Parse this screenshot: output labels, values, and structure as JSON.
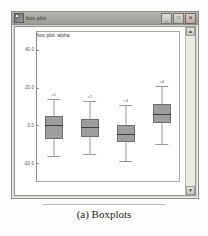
{
  "window": {
    "title": "box plot",
    "icon": "app-icon",
    "buttons": [
      {
        "name": "minimize",
        "glyph": "_"
      },
      {
        "name": "maximize",
        "glyph": "□"
      },
      {
        "name": "close",
        "glyph": "×"
      }
    ]
  },
  "scrollbar": {
    "up_glyph": "▲",
    "down_glyph": "▼"
  },
  "caption": {
    "text": "(a) Boxplots"
  },
  "chart_data": {
    "type": "box",
    "title": "box plot: alpha",
    "xlabel": "",
    "ylabel": "",
    "ylim": [
      -30,
      50
    ],
    "yticks": [
      40.0,
      20.0,
      0.0,
      -20.0
    ],
    "ytick_labels": [
      "40.0",
      "20.0",
      "0.0",
      "-20.0"
    ],
    "grid": false,
    "legend": "none",
    "categories": [
      "c1",
      "c2",
      "c3",
      "c4"
    ],
    "boxes": [
      {
        "label": "c1",
        "whisker_low": -16.0,
        "q1": -7.0,
        "median": 0.0,
        "q3": 5.0,
        "whisker_high": 14.0
      },
      {
        "label": "c2",
        "whisker_low": -15.0,
        "q1": -6.0,
        "median": -1.0,
        "q3": 3.5,
        "whisker_high": 13.0
      },
      {
        "label": "c3",
        "whisker_low": -19.0,
        "q1": -9.0,
        "median": -4.5,
        "q3": 0.0,
        "whisker_high": 11.0
      },
      {
        "label": "c4",
        "whisker_low": -10.0,
        "q1": 1.0,
        "median": 6.0,
        "q3": 11.5,
        "whisker_high": 21.0
      }
    ]
  }
}
